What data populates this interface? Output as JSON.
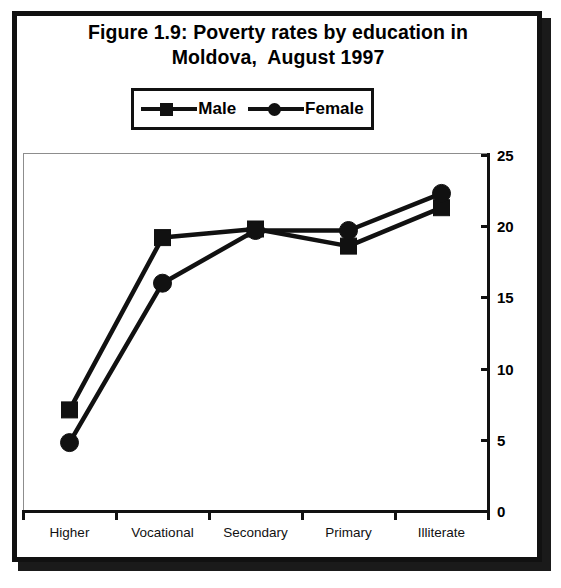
{
  "figure": {
    "title_line1": "Figure 1.9: Poverty rates by education in",
    "title_line2": "Moldova,  August 1997"
  },
  "legend": {
    "position": "top-center",
    "entries": [
      {
        "label": "Male",
        "marker": "square-marker"
      },
      {
        "label": "Female",
        "marker": "circle-marker"
      }
    ]
  },
  "axes": {
    "y_axis_side": "right",
    "y_ticks": [
      "0",
      "5",
      "10",
      "15",
      "20",
      "25"
    ],
    "x_ticks": [
      "Higher",
      "Vocational",
      "Secondary",
      "Primary",
      "Illiterate"
    ]
  },
  "chart_data": {
    "type": "line",
    "title": "Figure 1.9: Poverty rates by education in Moldova,  August 1997",
    "xlabel": "",
    "ylabel": "",
    "categories": [
      "Higher",
      "Vocational",
      "Secondary",
      "Primary",
      "Illiterate"
    ],
    "series": [
      {
        "name": "Male",
        "marker": "square",
        "values": [
          7.1,
          19.2,
          19.8,
          18.6,
          21.3
        ]
      },
      {
        "name": "Female",
        "marker": "circle",
        "values": [
          4.8,
          16.0,
          19.7,
          19.7,
          22.3
        ]
      }
    ],
    "ylim": [
      0,
      25
    ],
    "yticks": [
      0,
      5,
      10,
      15,
      20,
      25
    ],
    "grid": false,
    "legend_position": "top-center",
    "y_axis_position": "right",
    "line_color": "#111111"
  }
}
